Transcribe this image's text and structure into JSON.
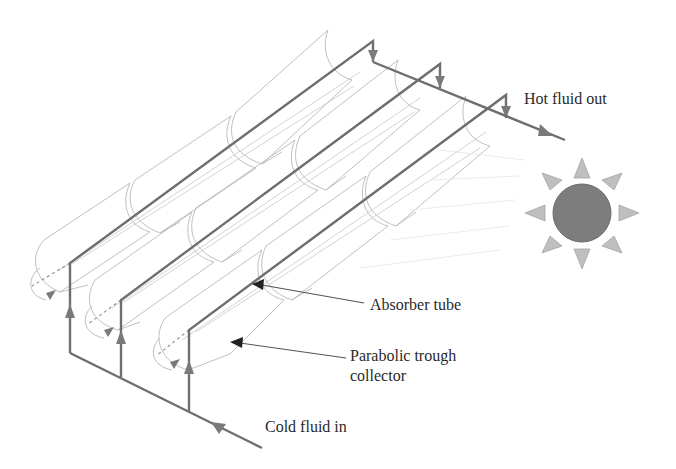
{
  "figure": {
    "labels": {
      "hot_out": "Hot fluid out",
      "absorber": "Absorber tube",
      "collector_line1": "Parabolic trough",
      "collector_line2": "collector",
      "cold_in": "Cold fluid in"
    },
    "rows": 3,
    "modules_per_row": 3,
    "icons": {
      "sun": "sun-icon",
      "flow_arrow": "flow-arrow-icon",
      "rotation": "tracking-rotation-icon"
    },
    "colors": {
      "pipe": "#6e6e6e",
      "trough_outline": "#b9b9b9",
      "sun_core": "#7d7d7d",
      "sun_rays": "#bfbfbf",
      "text": "#2a2a2a"
    }
  }
}
